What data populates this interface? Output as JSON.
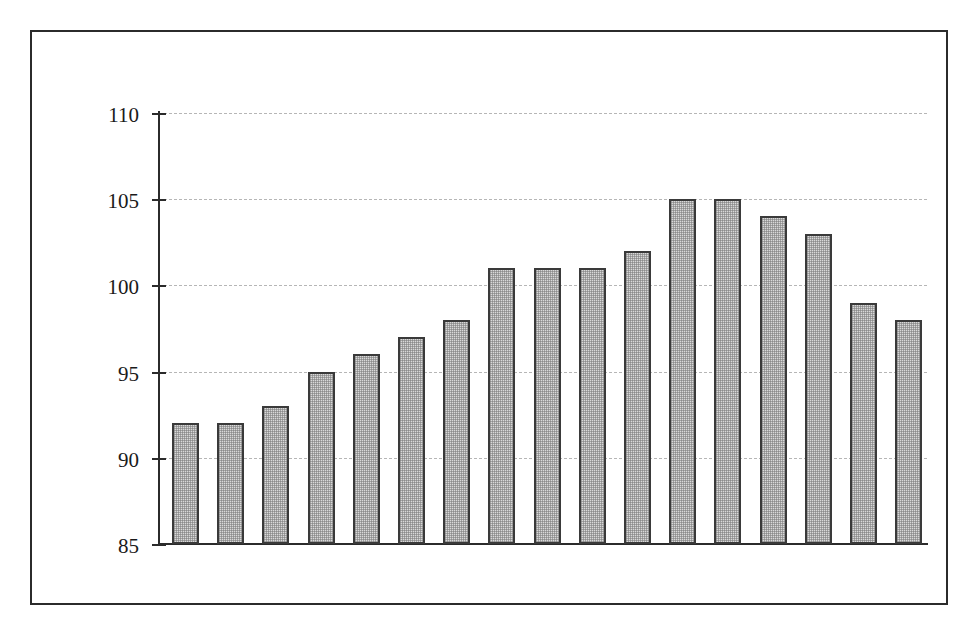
{
  "chart_data": {
    "type": "bar",
    "title": "",
    "subtitle": "",
    "xlabel": "",
    "ylabel": "",
    "categories": [
      "1995",
      "1996",
      "1997",
      "1998",
      "1999",
      "2000",
      "2001",
      "2002",
      "2003",
      "2004",
      "2005",
      "2006",
      "2007",
      "2008",
      "2009",
      "2010",
      "2011"
    ],
    "values": [
      92,
      92,
      93,
      95,
      96,
      97,
      98,
      101,
      101,
      101,
      102,
      105,
      105,
      104,
      103,
      99,
      98
    ],
    "series": [
      {
        "name": "",
        "values": [
          92,
          92,
          93,
          95,
          96,
          97,
          98,
          101,
          101,
          101,
          102,
          105,
          105,
          104,
          103,
          99,
          98
        ]
      }
    ],
    "ylim": [
      85,
      110
    ],
    "yticks": [
      85,
      90,
      95,
      100,
      105,
      110
    ],
    "ytick_labels": [
      "85",
      "90",
      "95",
      "100",
      "105",
      "110"
    ],
    "grid": true,
    "grid_axis": "y",
    "grid_style": "dashed",
    "legend": false,
    "legend_position": "none",
    "annotations": [],
    "xtick_rotation": -45,
    "colors": {
      "bar_fill": "#d9d9d9",
      "bar_edge": "#3a3a3a",
      "gridline": "#b6b6b6",
      "axis": "#2b2b2b",
      "frame": "#2b2b2b",
      "background": "#ffffff",
      "text": "#1a1a1a"
    }
  }
}
